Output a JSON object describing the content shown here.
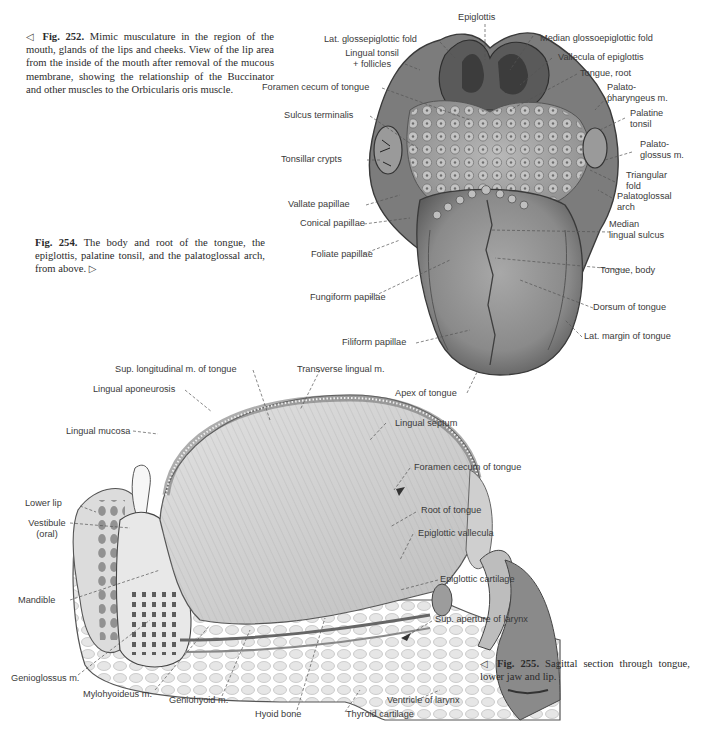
{
  "captions": {
    "fig252": {
      "number": "Fig. 252.",
      "text": "Mimic musculature in the region of the mouth, glands of the lips and cheeks. View of the lip area from the inside of the mouth after removal of the mucous membrane, showing the relationship of the Buccinator and other muscles to the Orbicularis oris muscle.",
      "pointer": "◁"
    },
    "fig254": {
      "number": "Fig. 254.",
      "text": "The body and root of the tongue, the epiglottis, palatine tonsil, and the palatoglossal arch, from above.",
      "pointer": "▷"
    },
    "fig255": {
      "number": "Fig. 255.",
      "text": "Sagittal section through tongue, lower jaw and lip.",
      "pointer": "◁"
    }
  },
  "figure254_labels": {
    "epiglottis": "Epiglottis",
    "lat_glossepiglottic_fold": "Lat. glossepiglottic fold",
    "median_glossoepiglottic_fold": "Median glossoepiglottic fold",
    "lingual_tonsil_1": "Lingual tonsil",
    "lingual_tonsil_2": "+ follicles",
    "vallecula_of_epiglottis": "Vallecula of epiglottis",
    "foramen_cecum": "Foramen cecum of tongue",
    "tongue_root": "Tongue, root",
    "palatopharyngeus_1": "Palato-",
    "palatopharyngeus_2": "pharyngeus m.",
    "sulcus_terminalis": "Sulcus terminalis",
    "palatine_tonsil_1": "Palatine",
    "palatine_tonsil_2": "tonsil",
    "tonsillar_crypts": "Tonsillar crypts",
    "palatoglossus_1": "Palato-",
    "palatoglossus_2": "glossus m.",
    "triangular_fold_1": "Triangular",
    "triangular_fold_2": "fold",
    "palatoglossal_arch_1": "Palatoglossal",
    "palatoglossal_arch_2": "arch",
    "vallate_papillae": "Vallate papillae",
    "conical_papillae": "Conical papillae",
    "median_lingual_sulcus_1": "Median",
    "median_lingual_sulcus_2": "lingual sulcus",
    "foliate_papillae": "Foliate papillae",
    "tongue_body": "Tongue, body",
    "fungiform_papillae": "Fungiform papillae",
    "dorsum_of_tongue": "Dorsum of tongue",
    "filiform_papillae": "Filiform papillae",
    "lat_margin_of_tongue": "Lat. margin of tongue",
    "apex_of_tongue": "Apex of tongue"
  },
  "figure255_labels": {
    "sup_longitudinal": "Sup. longitudinal m. of tongue",
    "transverse_lingual": "Transverse lingual m.",
    "lingual_aponeurosis": "Lingual aponeurosis",
    "lingual_mucosa": "Lingual mucosa",
    "lingual_septum": "Lingual septum",
    "foramen_cecum": "Foramen cecum of tongue",
    "lower_lip": "Lower lip",
    "vestibule_1": "Vestibule",
    "vestibule_2": "(oral)",
    "root_of_tongue": "Root of tongue",
    "epiglottic_vallecula": "Epiglottic vallecula",
    "epiglottic_cartilage": "Epiglottic cartilage",
    "mandible": "Mandible",
    "sup_aperture_of_larynx": "Sup. aperture of larynx",
    "genioglossus": "Genioglossus m.",
    "mylohyoideus": "Mylohyoideus m.",
    "geniohyoid": "Geniohyoid m.",
    "hyoid_bone": "Hyoid bone",
    "thyroid_cartilage": "Thyroid cartilage",
    "ventricle_of_larynx": "Ventricle of larynx"
  },
  "colors": {
    "text": "#3a3a3a",
    "tissue_dark": "#6e6e6e",
    "tissue_mid": "#9a9a9a",
    "tissue_light": "#cfcfcf",
    "background": "#ffffff"
  }
}
